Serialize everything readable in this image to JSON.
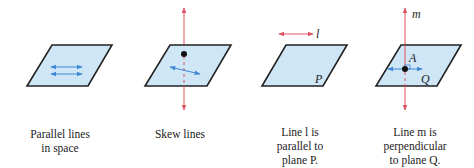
{
  "figures": [
    {
      "id": "parallel-lines",
      "caption_lines": [
        "Parallel lines",
        "in space"
      ]
    },
    {
      "id": "skew-lines",
      "caption_lines": [
        "Skew lines"
      ]
    },
    {
      "id": "line-parallel-plane",
      "caption_lines": [
        "Line l is",
        "parallel to",
        "plane P."
      ],
      "line_label": "l",
      "plane_label": "P"
    },
    {
      "id": "line-perpendicular-plane",
      "caption_lines": [
        "Line m is",
        "perpendicular",
        "to plane Q."
      ],
      "line_label": "m",
      "point_label": "A",
      "plane_label": "Q"
    }
  ],
  "colors": {
    "plane_fill": "#cfe6f7",
    "plane_stroke": "#222222",
    "blue_line": "#3f86d6",
    "red_line": "#e0525e",
    "point": "#111111"
  }
}
